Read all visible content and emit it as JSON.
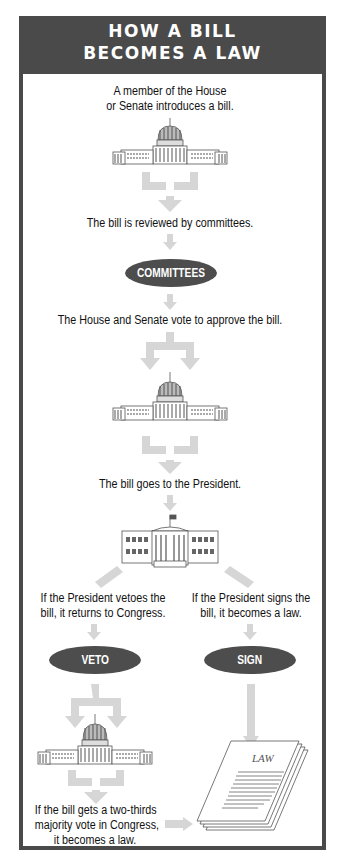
{
  "title": {
    "line1": "HOW A BILL",
    "line2": "BECOMES A LAW"
  },
  "colors": {
    "frame": "#4a4a4a",
    "arrow": "#d6d6d6",
    "oval": "#4d4d4d",
    "text": "#111111"
  },
  "steps": {
    "introduce": {
      "line1": "A member of the House",
      "line2": "or Senate introduces a bill.",
      "icon": "capitol-icon"
    },
    "committee_review": {
      "text": "The bill is reviewed by committees.",
      "badge": "COMMITTEES"
    },
    "vote": {
      "text": "The House and Senate vote to approve the bill.",
      "icon": "capitol-icon"
    },
    "president": {
      "text": "The bill goes to the President.",
      "icon": "white-house-icon"
    },
    "veto_branch": {
      "line1": "If the President vetoes the",
      "line2": "bill,  it returns to Congress.",
      "badge": "VETO"
    },
    "sign_branch": {
      "line1": "If the President signs the",
      "line2": "bill, it becomes a law.",
      "badge": "SIGN"
    },
    "override": {
      "line1": "If the bill gets a two-thirds",
      "line2": "majority vote in Congress,",
      "line3": "it becomes a law.",
      "icon": "capitol-icon"
    },
    "law": {
      "label": "LAW",
      "icon": "law-document-icon"
    }
  }
}
